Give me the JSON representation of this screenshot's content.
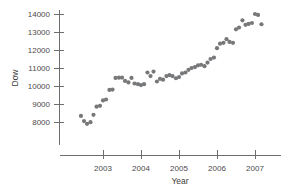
{
  "chart_data": {
    "type": "scatter",
    "title": "",
    "xlabel": "Year",
    "ylabel": "Dow",
    "xlim": [
      2002.3,
      2007.35
    ],
    "ylim": [
      7400,
      14350
    ],
    "xticks": [
      2003,
      2004,
      2005,
      2006,
      2007
    ],
    "xtick_labels": [
      "2003",
      "2004",
      "2005",
      "2006",
      "2007"
    ],
    "yticks": [
      8000,
      9000,
      10000,
      11000,
      12000,
      13000,
      14000
    ],
    "ytick_labels": [
      "8000",
      "9000",
      "10000",
      "11000",
      "12000",
      "13000",
      "14000"
    ],
    "grid": false,
    "legend": null,
    "marker_color": "#77787a",
    "axis_color": "#6e6e6e",
    "background_color": "#ffffff",
    "x": [
      2002.42,
      2002.5,
      2002.58,
      2002.67,
      2002.75,
      2002.83,
      2002.92,
      2003.0,
      2003.08,
      2003.17,
      2003.25,
      2003.33,
      2003.42,
      2003.5,
      2003.58,
      2003.67,
      2003.75,
      2003.83,
      2003.92,
      2004.0,
      2004.08,
      2004.17,
      2004.25,
      2004.33,
      2004.42,
      2004.5,
      2004.58,
      2004.67,
      2004.75,
      2004.83,
      2004.92,
      2005.0,
      2005.08,
      2005.17,
      2005.25,
      2005.33,
      2005.42,
      2005.5,
      2005.58,
      2005.67,
      2005.75,
      2005.83,
      2005.92,
      2006.0,
      2006.08,
      2006.17,
      2006.25,
      2006.33,
      2006.42,
      2006.5,
      2006.58,
      2006.67,
      2006.75,
      2006.83,
      2006.92,
      2007.0,
      2007.08,
      2007.17
    ],
    "y": [
      8340,
      8050,
      7900,
      7990,
      8400,
      8850,
      8900,
      9200,
      9250,
      9780,
      9800,
      10450,
      10460,
      10470,
      10280,
      10200,
      10450,
      10140,
      10100,
      10050,
      10100,
      10750,
      10550,
      10800,
      10250,
      10400,
      10350,
      10550,
      10600,
      10550,
      10430,
      10500,
      10700,
      10750,
      10900,
      11000,
      11050,
      11150,
      11180,
      11100,
      11300,
      11500,
      11580,
      12100,
      12350,
      12400,
      12600,
      12450,
      12400,
      13150,
      13250,
      13650,
      13400,
      13450,
      13500,
      14000,
      13950,
      13430
    ]
  }
}
